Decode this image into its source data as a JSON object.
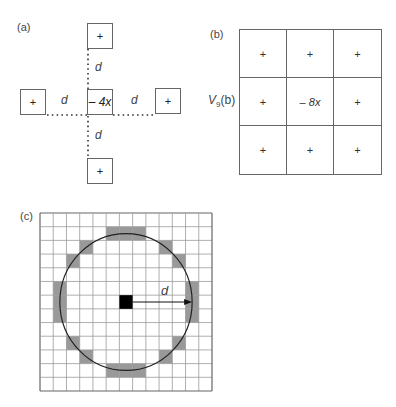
{
  "panel_a": {
    "label": "(a)",
    "center_value": "– 4x",
    "neighbor_symbol": "+",
    "distance_label": "d",
    "neighbors": [
      "top",
      "left",
      "right",
      "bottom"
    ]
  },
  "panel_b": {
    "label": "(b)",
    "row_label": "V",
    "row_label_sub": "9",
    "row_label_suffix": "(b)",
    "cells": [
      [
        "+",
        "+",
        "+"
      ],
      [
        "+",
        "– 8x",
        "+"
      ],
      [
        "+",
        "+",
        "+"
      ]
    ]
  },
  "panel_c": {
    "label": "(c)",
    "grid_size": 13,
    "center_cell": [
      6,
      6
    ],
    "radius_label": "d",
    "shaded_cells": [
      [
        5,
        1
      ],
      [
        6,
        1
      ],
      [
        7,
        1
      ],
      [
        3,
        2
      ],
      [
        9,
        2
      ],
      [
        2,
        3
      ],
      [
        10,
        3
      ],
      [
        1,
        5
      ],
      [
        1,
        6
      ],
      [
        1,
        7
      ],
      [
        11,
        5
      ],
      [
        11,
        6
      ],
      [
        11,
        7
      ],
      [
        2,
        9
      ],
      [
        10,
        9
      ],
      [
        3,
        10
      ],
      [
        9,
        10
      ],
      [
        5,
        11
      ],
      [
        6,
        11
      ],
      [
        7,
        11
      ]
    ],
    "colors": {
      "grid": "#9a9a9a",
      "shade": "#999999",
      "center": "#000000",
      "circle": "#222222"
    }
  }
}
